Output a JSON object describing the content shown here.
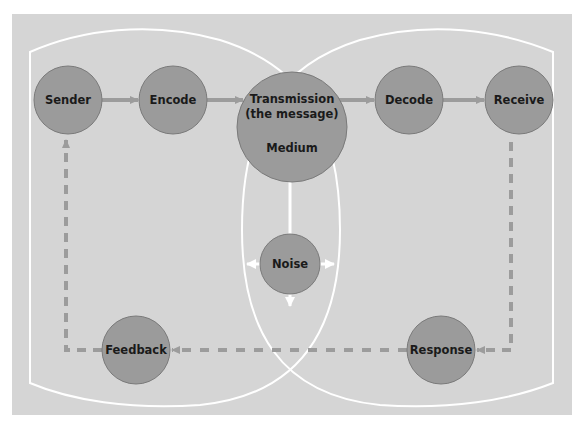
{
  "diagram": {
    "colors": {
      "background": "#d5d5d5",
      "node_fill": "#9b9b9b",
      "node_stroke": "#7a7a7a",
      "arrow": "#9c9c9c",
      "outline": "#ffffff",
      "text": "#1a1a1a"
    },
    "nodes": {
      "sender": "Sender",
      "encode": "Encode",
      "transmission_line1": "Transmission",
      "transmission_line2": "(the message)",
      "medium": "Medium",
      "decode": "Decode",
      "receive": "Receive",
      "noise": "Noise",
      "feedback": "Feedback",
      "response": "Response"
    },
    "edges": [
      {
        "from": "Sender",
        "to": "Encode",
        "style": "solid"
      },
      {
        "from": "Encode",
        "to": "Transmission",
        "style": "solid"
      },
      {
        "from": "Transmission",
        "to": "Decode",
        "style": "solid"
      },
      {
        "from": "Decode",
        "to": "Receive",
        "style": "solid"
      },
      {
        "from": "Receive",
        "to": "Response",
        "style": "dashed"
      },
      {
        "from": "Response",
        "to": "Feedback",
        "style": "dashed"
      },
      {
        "from": "Feedback",
        "to": "Sender",
        "style": "dashed"
      },
      {
        "from": "Noise",
        "to": "Medium",
        "style": "solid-white"
      }
    ]
  }
}
